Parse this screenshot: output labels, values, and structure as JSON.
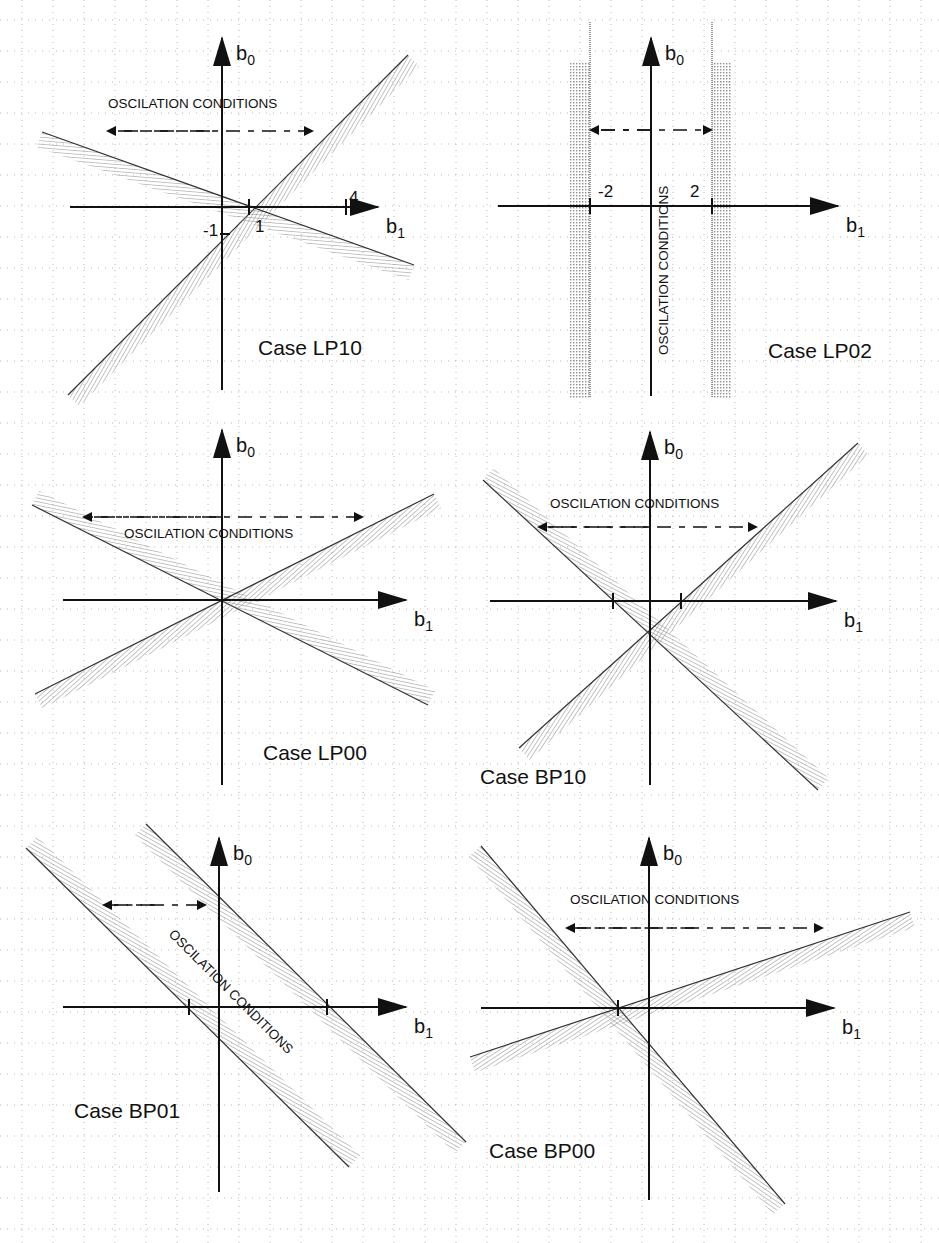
{
  "figure": {
    "width": 939,
    "height": 1243,
    "grid": {
      "spacing": 31,
      "color": "#b8b8b8"
    },
    "hatch_color": "#8a8a8a",
    "line_color": "#111111"
  },
  "chart_data": [
    {
      "type": "diagram",
      "title": "Case LP10",
      "xlabel": "b1",
      "ylabel": "b0",
      "origin": [
        222,
        207
      ],
      "x_axis": [
        70,
        378
      ],
      "y_axis": [
        390,
        38
      ],
      "ticks": [
        {
          "x": 249,
          "label": "1",
          "lx": 255,
          "ly": 232
        },
        {
          "x": 346,
          "label": "4",
          "lx": 349,
          "ly": 203
        }
      ],
      "y_ticks": [
        {
          "label": "-1",
          "lx": 203,
          "ly": 236
        }
      ],
      "annotation": {
        "text": "OSCILATION CONDITIONS",
        "x": 108,
        "y": 108,
        "rotate": 0
      },
      "arrow": {
        "x1": 108,
        "x2": 312,
        "y": 131
      },
      "boundaries": [
        {
          "x1": 68,
          "y1": 395,
          "x2": 408,
          "y2": 55,
          "hatch_side": 1
        },
        {
          "x1": 42,
          "y1": 132,
          "x2": 414,
          "y2": 265,
          "hatch_side": 1
        }
      ],
      "case_label": {
        "text": "Case LP10",
        "x": 258,
        "y": 355
      }
    },
    {
      "type": "diagram",
      "title": "Case LP02",
      "xlabel": "b1",
      "ylabel": "b0",
      "origin": [
        651,
        206
      ],
      "x_axis": [
        498,
        838
      ],
      "y_axis": [
        396,
        38
      ],
      "ticks": [
        {
          "x": 590,
          "label": "-2",
          "lx": 598,
          "ly": 197
        },
        {
          "x": 712,
          "label": "2",
          "lx": 690,
          "ly": 197
        }
      ],
      "y_ticks": [],
      "annotation": {
        "text": "OSCILATION CONDITIONS",
        "x": 668,
        "y": 355,
        "rotate": -90
      },
      "arrow": {
        "x1": 591,
        "x2": 711,
        "y": 130
      },
      "vertical_bands": [
        {
          "x": 590,
          "side": -1
        },
        {
          "x": 712,
          "side": 1
        }
      ],
      "band_range": [
        62,
        398
      ],
      "boundaries": [],
      "case_label": {
        "text": "Case LP02",
        "x": 768,
        "y": 358
      }
    },
    {
      "type": "diagram",
      "title": "Case LP00",
      "xlabel": "b1",
      "ylabel": "b0",
      "origin": [
        222,
        600
      ],
      "x_axis": [
        63,
        406
      ],
      "y_axis": [
        785,
        430
      ],
      "ticks": [],
      "y_ticks": [],
      "annotation": {
        "text": "OSCILATION CONDITIONS",
        "x": 124,
        "y": 538,
        "rotate": 0
      },
      "arrow": {
        "x1": 84,
        "x2": 362,
        "y": 517
      },
      "boundaries": [
        {
          "x1": 32,
          "y1": 505,
          "x2": 428,
          "y2": 705,
          "hatch_side": -1
        },
        {
          "x1": 35,
          "y1": 694,
          "x2": 434,
          "y2": 494,
          "hatch_side": 1
        }
      ],
      "case_label": {
        "text": "Case LP00",
        "x": 263,
        "y": 760
      }
    },
    {
      "type": "diagram",
      "title": "Case BP10",
      "xlabel": "b1",
      "ylabel": "b0",
      "origin": [
        650,
        601
      ],
      "x_axis": [
        490,
        836
      ],
      "y_axis": [
        785,
        432
      ],
      "ticks": [
        {
          "x": 613,
          "label": ""
        },
        {
          "x": 681,
          "label": ""
        }
      ],
      "y_ticks": [],
      "annotation": {
        "text": "OSCILATION CONDITIONS",
        "x": 550,
        "y": 508,
        "rotate": 0
      },
      "arrow": {
        "x1": 539,
        "x2": 756,
        "y": 527
      },
      "boundaries": [
        {
          "x1": 483,
          "y1": 480,
          "x2": 818,
          "y2": 790,
          "hatch_side": -1
        },
        {
          "x1": 519,
          "y1": 748,
          "x2": 858,
          "y2": 443,
          "hatch_side": 1
        }
      ],
      "case_label": {
        "text": "Case BP10",
        "x": 480,
        "y": 784
      }
    },
    {
      "type": "diagram",
      "title": "Case BP01",
      "xlabel": "b1",
      "ylabel": "b0",
      "origin": [
        219,
        1007
      ],
      "x_axis": [
        63,
        406
      ],
      "y_axis": [
        1192,
        838
      ],
      "ticks": [
        {
          "x": 189,
          "label": ""
        },
        {
          "x": 327,
          "label": ""
        }
      ],
      "y_ticks": [],
      "annotation": {
        "text": "OSCILATION CONDITIONS",
        "x": 168,
        "y": 935,
        "rotate": 45
      },
      "arrow": {
        "x1": 104,
        "x2": 205,
        "y": 905
      },
      "boundaries": [
        {
          "x1": 26,
          "y1": 848,
          "x2": 349,
          "y2": 1167,
          "hatch_side": -1
        },
        {
          "x1": 146,
          "y1": 824,
          "x2": 466,
          "y2": 1142,
          "hatch_side": 1
        }
      ],
      "case_label": {
        "text": "Case BP01",
        "x": 74,
        "y": 1118
      }
    },
    {
      "type": "diagram",
      "title": "Case BP00",
      "xlabel": "b1",
      "ylabel": "b0",
      "origin": [
        649,
        1008
      ],
      "x_axis": [
        481,
        834
      ],
      "y_axis": [
        1200,
        838
      ],
      "ticks": [
        {
          "x": 618,
          "label": ""
        }
      ],
      "y_ticks": [],
      "annotation": {
        "text": "OSCILATION CONDITIONS",
        "x": 570,
        "y": 904,
        "rotate": 0
      },
      "arrow": {
        "x1": 567,
        "x2": 822,
        "y": 928
      },
      "boundaries": [
        {
          "x1": 481,
          "y1": 846,
          "x2": 785,
          "y2": 1204,
          "hatch_side": 1
        },
        {
          "x1": 470,
          "y1": 1057,
          "x2": 910,
          "y2": 912,
          "hatch_side": 1
        }
      ],
      "case_label": {
        "text": "Case BP00",
        "x": 489,
        "y": 1158
      }
    }
  ]
}
